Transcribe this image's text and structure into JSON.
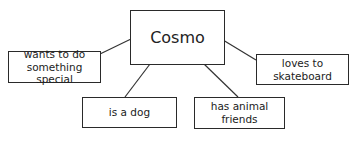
{
  "diagram": {
    "type": "concept-map",
    "center": {
      "label": "Cosmo"
    },
    "nodes": [
      {
        "id": "wants",
        "label": "wants to do\nsomething special"
      },
      {
        "id": "dog",
        "label": "is a dog"
      },
      {
        "id": "friends",
        "label": "has animal\nfriends"
      },
      {
        "id": "skate",
        "label": "loves to\nskateboard"
      }
    ],
    "edges": [
      {
        "from": "Cosmo",
        "to": "wants"
      },
      {
        "from": "Cosmo",
        "to": "dog"
      },
      {
        "from": "Cosmo",
        "to": "friends"
      },
      {
        "from": "Cosmo",
        "to": "skate"
      }
    ]
  }
}
